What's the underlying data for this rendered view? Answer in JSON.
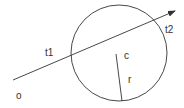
{
  "diagram": {
    "colors": {
      "stroke": "#333333",
      "background": "#ffffff"
    },
    "circle": {
      "cx": 119,
      "cy": 53,
      "r": 48
    },
    "ray": {
      "x1": 13,
      "y1": 80,
      "x2": 175,
      "y2": 11
    },
    "radius_line": {
      "x1": 116,
      "y1": 54,
      "x2": 122,
      "y2": 101
    },
    "labels": {
      "origin": "o",
      "t1": "t1",
      "t2": "t2",
      "center": "c",
      "radius": "r"
    }
  }
}
